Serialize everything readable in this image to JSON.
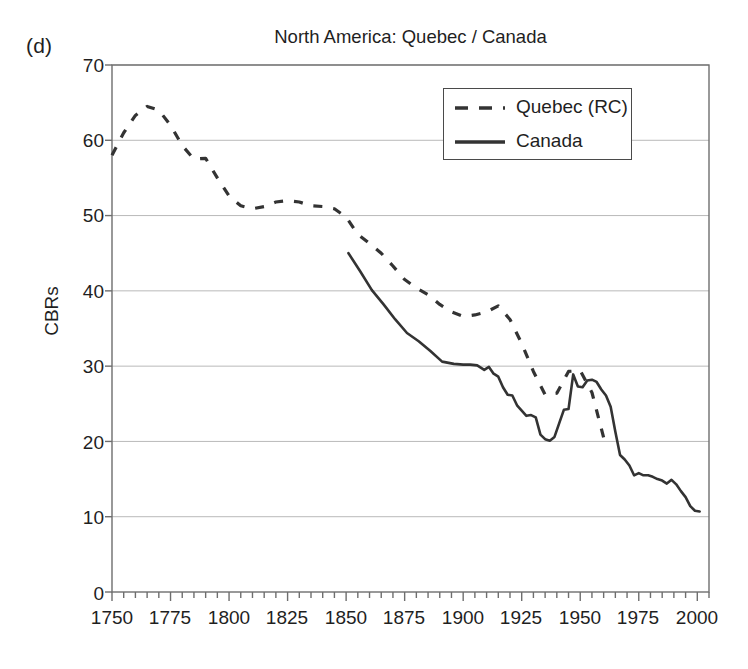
{
  "figure": {
    "panel_label": "(d)",
    "title": "North America: Quebec / Canada",
    "ylabel": "CBRs",
    "background": "#ffffff",
    "line_color": "#333333",
    "grid_color": "#b9b9b9",
    "frame_color": "#6e6e6e"
  },
  "legend": {
    "position": "top-right-inside",
    "entries": [
      {
        "label": "Quebec (RC)",
        "style": "dashed"
      },
      {
        "label": "Canada",
        "style": "solid"
      }
    ]
  },
  "chart_data": {
    "type": "line",
    "title": "North America: Quebec / Canada",
    "subtitle": "",
    "panel": "(d)",
    "xlabel": "",
    "ylabel": "CBRs",
    "xlim": [
      1750,
      2005
    ],
    "ylim": [
      0,
      70
    ],
    "xticks": [
      1750,
      1775,
      1800,
      1825,
      1850,
      1875,
      1900,
      1925,
      1950,
      1975,
      2000
    ],
    "yticks": [
      0,
      10,
      20,
      30,
      40,
      50,
      60,
      70
    ],
    "xminor_tick_step": 5,
    "grid": "horizontal",
    "legend_position": "upper right inside",
    "annotations": [],
    "series": [
      {
        "name": "Quebec (RC)",
        "style": "dashed",
        "color": "#333333",
        "x": [
          1750,
          1755,
          1760,
          1765,
          1770,
          1775,
          1780,
          1785,
          1790,
          1795,
          1800,
          1805,
          1810,
          1815,
          1820,
          1825,
          1830,
          1835,
          1840,
          1845,
          1850,
          1855,
          1860,
          1865,
          1870,
          1875,
          1880,
          1885,
          1890,
          1895,
          1900,
          1905,
          1910,
          1915,
          1920,
          1925,
          1930,
          1935,
          1940,
          1945,
          1950,
          1955,
          1960
        ],
        "y": [
          58.0,
          61.0,
          63.3,
          64.5,
          64.0,
          62.0,
          59.3,
          57.5,
          57.6,
          55.0,
          52.6,
          51.3,
          50.9,
          51.2,
          51.8,
          52.0,
          51.8,
          51.3,
          51.2,
          50.9,
          49.8,
          47.5,
          46.3,
          45.0,
          43.3,
          41.5,
          40.4,
          39.5,
          38.2,
          37.2,
          36.6,
          36.8,
          37.2,
          38.0,
          36.2,
          33.0,
          29.3,
          26.2,
          26.4,
          29.3,
          29.4,
          26.5,
          20.5
        ]
      },
      {
        "name": "Canada",
        "style": "solid",
        "color": "#333333",
        "x": [
          1851,
          1856,
          1861,
          1866,
          1871,
          1876,
          1881,
          1886,
          1891,
          1896,
          1900,
          1903,
          1906,
          1909,
          1911,
          1913,
          1915,
          1917,
          1919,
          1921,
          1923,
          1925,
          1927,
          1929,
          1931,
          1933,
          1935,
          1937,
          1939,
          1941,
          1943,
          1945,
          1947,
          1949,
          1951,
          1953,
          1955,
          1957,
          1959,
          1961,
          1963,
          1965,
          1967,
          1969,
          1971,
          1973,
          1975,
          1977,
          1979,
          1981,
          1983,
          1985,
          1987,
          1989,
          1991,
          1993,
          1995,
          1997,
          1999,
          2001
        ],
        "y": [
          45.0,
          42.6,
          40.1,
          38.2,
          36.2,
          34.4,
          33.3,
          32.0,
          30.6,
          30.3,
          30.2,
          30.2,
          30.1,
          29.5,
          29.9,
          29.0,
          28.6,
          27.2,
          26.2,
          26.1,
          24.8,
          24.1,
          23.4,
          23.5,
          23.2,
          20.9,
          20.3,
          20.1,
          20.6,
          22.4,
          24.2,
          24.3,
          28.9,
          27.3,
          27.2,
          28.1,
          28.2,
          27.9,
          26.9,
          26.1,
          24.6,
          21.3,
          18.2,
          17.6,
          16.8,
          15.5,
          15.8,
          15.5,
          15.5,
          15.3,
          15.0,
          14.8,
          14.4,
          14.9,
          14.3,
          13.4,
          12.6,
          11.4,
          10.8,
          10.7
        ]
      }
    ]
  }
}
